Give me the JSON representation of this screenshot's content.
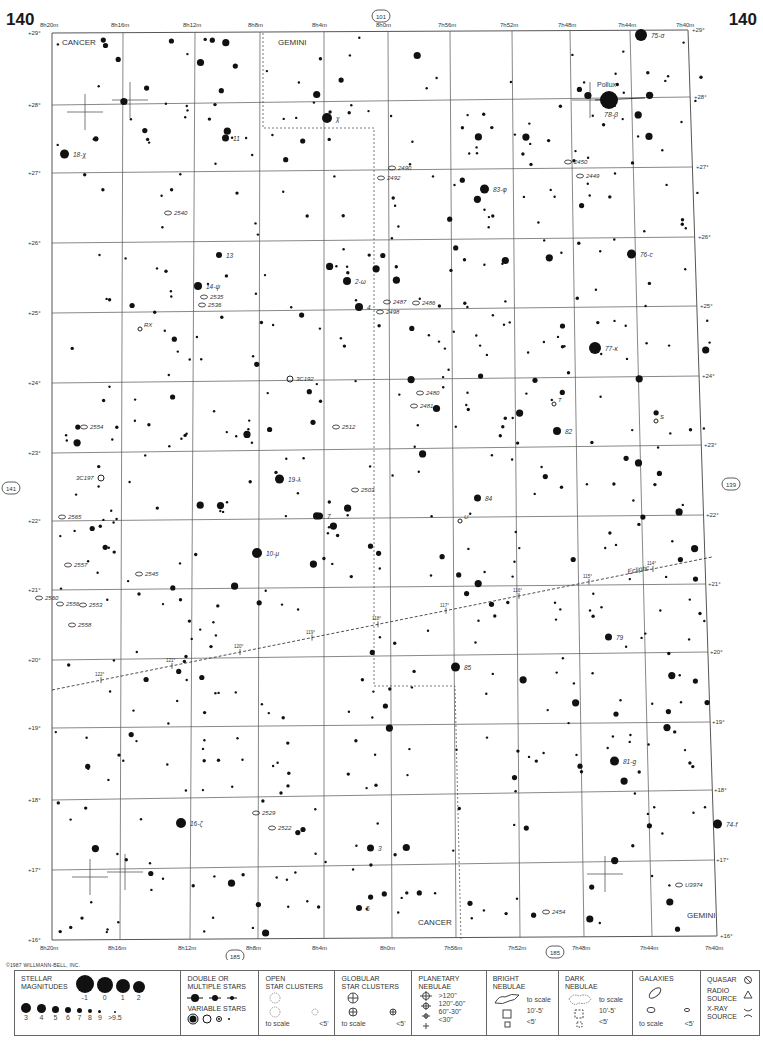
{
  "page": {
    "number_left": "140",
    "number_right": "140",
    "copyright": "©1987 WILLMANN-BELL, INC."
  },
  "chart": {
    "ra_labels_top": [
      "8h20m",
      "8h16m",
      "8h12m",
      "8h8m",
      "8h4m",
      "8h0m",
      "7h56m",
      "7h52m",
      "7h48m",
      "7h44m",
      "7h40m"
    ],
    "ra_labels_bottom": [
      "8h20m",
      "8h16m",
      "8h12m",
      "8h8m",
      "8h4m",
      "8h0m",
      "7h56m",
      "7h52m",
      "7h48m",
      "7h44m",
      "7h40m"
    ],
    "dec_labels": [
      "+29°",
      "+28°",
      "+27°",
      "+26°",
      "+25°",
      "+24°",
      "+23°",
      "+22°",
      "+21°",
      "+20°",
      "+19°",
      "+18°",
      "+17°",
      "+16°"
    ],
    "adjacent_charts": {
      "top": "101",
      "left": "141",
      "right": "139",
      "bottom_left": "185",
      "bottom_right": "185"
    },
    "constellations": [
      {
        "name": "CANCER",
        "x": 62,
        "y": 45
      },
      {
        "name": "GEMINI",
        "x": 278,
        "y": 45
      },
      {
        "name": "CANCER",
        "x": 418,
        "y": 925
      },
      {
        "name": "GEMINI",
        "x": 687,
        "y": 918
      }
    ],
    "ecliptic": {
      "label": "Ecliptic",
      "ticks": [
        "122°",
        "121°",
        "120°",
        "119°",
        "118°",
        "117°",
        "116°",
        "115°",
        "114°"
      ]
    },
    "named_stars": [
      {
        "label": "Pollux",
        "x": 609,
        "y": 87
      },
      {
        "label": "78-β",
        "x": 604,
        "y": 117
      },
      {
        "label": "75-σ",
        "x": 651,
        "y": 38
      },
      {
        "label": "χ",
        "x": 336,
        "y": 121
      },
      {
        "label": "11",
        "x": 233,
        "y": 141
      },
      {
        "label": "18-χ",
        "x": 73,
        "y": 157
      },
      {
        "label": "83-φ",
        "x": 493,
        "y": 192
      },
      {
        "label": "76-c",
        "x": 640,
        "y": 257
      },
      {
        "label": "13",
        "x": 226,
        "y": 258
      },
      {
        "label": "14-ψ",
        "x": 206,
        "y": 289
      },
      {
        "label": "2-ω",
        "x": 355,
        "y": 284
      },
      {
        "label": "4",
        "x": 367,
        "y": 310
      },
      {
        "label": "77-κ",
        "x": 605,
        "y": 351
      },
      {
        "label": "82",
        "x": 565,
        "y": 434
      },
      {
        "label": "19-λ",
        "x": 288,
        "y": 482
      },
      {
        "label": "84",
        "x": 485,
        "y": 501
      },
      {
        "label": "7",
        "x": 327,
        "y": 519
      },
      {
        "label": "10-μ",
        "x": 266,
        "y": 556
      },
      {
        "label": "79",
        "x": 616,
        "y": 640
      },
      {
        "label": "85",
        "x": 464,
        "y": 670
      },
      {
        "label": "81-g",
        "x": 623,
        "y": 764
      },
      {
        "label": "74-f",
        "x": 726,
        "y": 827
      },
      {
        "label": "16-ζ",
        "x": 190,
        "y": 826
      },
      {
        "label": "3",
        "x": 378,
        "y": 851
      },
      {
        "label": "5",
        "x": 366,
        "y": 911
      }
    ],
    "deep_sky": [
      {
        "label": "2540",
        "x": 174,
        "y": 215
      },
      {
        "label": "2535",
        "x": 210,
        "y": 299
      },
      {
        "label": "2536",
        "x": 208,
        "y": 307
      },
      {
        "label": "RX",
        "x": 144,
        "y": 327
      },
      {
        "label": "3C192",
        "x": 296,
        "y": 381
      },
      {
        "label": "2554",
        "x": 90,
        "y": 429
      },
      {
        "label": "2512",
        "x": 342,
        "y": 429
      },
      {
        "label": "3C197",
        "x": 76,
        "y": 480
      },
      {
        "label": "2503",
        "x": 361,
        "y": 492
      },
      {
        "label": "2565",
        "x": 68,
        "y": 519
      },
      {
        "label": "2557",
        "x": 74,
        "y": 567
      },
      {
        "label": "2545",
        "x": 145,
        "y": 576
      },
      {
        "label": "2560",
        "x": 45,
        "y": 600
      },
      {
        "label": "2556",
        "x": 66,
        "y": 606
      },
      {
        "label": "2553",
        "x": 89,
        "y": 607
      },
      {
        "label": "2558",
        "x": 78,
        "y": 627
      },
      {
        "label": "2490",
        "x": 398,
        "y": 170
      },
      {
        "label": "2492",
        "x": 387,
        "y": 180
      },
      {
        "label": "2450",
        "x": 574,
        "y": 164
      },
      {
        "label": "2449",
        "x": 586,
        "y": 178
      },
      {
        "label": "2487",
        "x": 393,
        "y": 304
      },
      {
        "label": "2486",
        "x": 422,
        "y": 305
      },
      {
        "label": "2498",
        "x": 386,
        "y": 314
      },
      {
        "label": "2480",
        "x": 426,
        "y": 395
      },
      {
        "label": "2481",
        "x": 420,
        "y": 408
      },
      {
        "label": "T",
        "x": 558,
        "y": 402
      },
      {
        "label": "S",
        "x": 660,
        "y": 419
      },
      {
        "label": "U",
        "x": 464,
        "y": 519
      },
      {
        "label": "2529",
        "x": 262,
        "y": 815
      },
      {
        "label": "2522",
        "x": 278,
        "y": 830
      },
      {
        "label": "U3974",
        "x": 685,
        "y": 887
      },
      {
        "label": "2454",
        "x": 552,
        "y": 914
      }
    ]
  },
  "legend": {
    "stellar": {
      "title_line1": "STELLAR",
      "title_line2": "MAGNITUDES",
      "bright": [
        "-1",
        "0",
        "1",
        "2"
      ],
      "faint": [
        "3",
        "4",
        "5",
        "6",
        "7",
        "8",
        "9",
        ">9.5"
      ]
    },
    "double": {
      "title_line1": "DOUBLE OR",
      "title_line2": "MULTIPLE STARS",
      "variable_title": "VARIABLE STARS"
    },
    "open_clusters": {
      "title_line1": "OPEN",
      "title_line2": "STAR CLUSTERS",
      "to_scale": "to scale",
      "small": "<5'"
    },
    "globular": {
      "title_line1": "GLOBULAR",
      "title_line2": "STAR CLUSTERS",
      "to_scale": "to scale",
      "small": "<5'"
    },
    "planetary": {
      "title_line1": "PLANETARY",
      "title_line2": "NEBULAE",
      "sizes": [
        ">120\"",
        "120\"-60\"",
        "60\"-30\"",
        "<30\""
      ]
    },
    "bright_nebulae": {
      "title_line1": "BRIGHT",
      "title_line2": "NEBULAE",
      "to_scale": "to scale",
      "mid": "10'-5'",
      "small": "<5'"
    },
    "dark_nebulae": {
      "title_line1": "DARK",
      "title_line2": "NEBULAE",
      "to_scale": "to scale",
      "mid": "10'-5'",
      "small": "<5'"
    },
    "galaxies": {
      "title": "GALAXIES",
      "to_scale": "to scale",
      "small": "<5'"
    },
    "other": {
      "quasar": "QUASAR",
      "radio_line1": "RADIO",
      "radio_line2": "SOURCE",
      "xray_line1": "X-RAY",
      "xray_line2": "SOURCE"
    }
  }
}
